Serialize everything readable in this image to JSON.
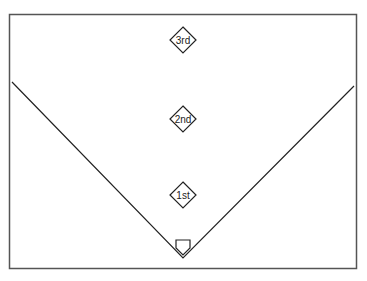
{
  "diagram": {
    "type": "baseball-field",
    "bases": [
      {
        "label": "3rd",
        "x": 183,
        "y": 40
      },
      {
        "label": "2nd",
        "x": 183,
        "y": 119
      },
      {
        "label": "1st",
        "x": 183,
        "y": 195
      }
    ],
    "home_plate": {
      "x": 183,
      "y": 244
    },
    "foul_lines": {
      "left_start": [
        12,
        82
      ],
      "apex": [
        183,
        258
      ],
      "right_end": [
        354,
        86
      ]
    },
    "colors": {
      "line": "#222222",
      "border": "#555555",
      "background": "#ffffff"
    }
  }
}
